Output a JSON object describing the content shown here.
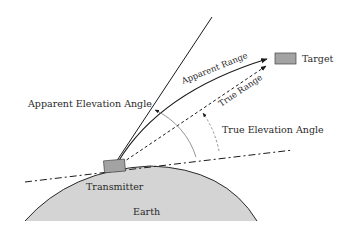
{
  "diagram": {
    "labels": {
      "target": "Target",
      "apparent_range": "Apparent Range",
      "true_range": "True Range",
      "apparent_elevation_angle": "Apparent Elevation Angle",
      "true_elevation_angle": "True Elevation Angle",
      "transmitter": "Transmitter",
      "earth": "Earth"
    },
    "colors": {
      "earth_fill": "#d4d4d4",
      "earth_outline": "#2a2a2a",
      "box_fill": "#a3a3a3",
      "box_stroke": "#444444",
      "line": "#1a1a1a",
      "arc": "#888888",
      "text": "#2a2a2a"
    }
  }
}
